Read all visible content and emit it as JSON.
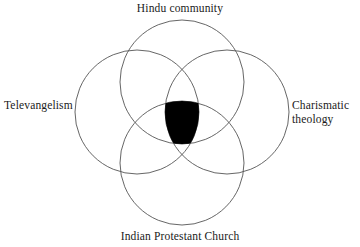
{
  "figure": {
    "type": "venn-diagram-4-circle",
    "background_color": "#ffffff",
    "stroke_color": "#555555",
    "fill_color": "#ffffff",
    "intersection_fill_color": "#000000",
    "text_color": "#1a1a1a"
  },
  "labels": {
    "top": "Hindu community",
    "left": "Televangelism",
    "right": "Charismatic\ntheology",
    "bottom": "Indian Protestant Church"
  },
  "chart_data": {
    "type": "venn",
    "title": "",
    "sets": [
      {
        "id": "hindu-community",
        "label": "Hindu community",
        "position": "top",
        "cx": 182,
        "cy": 82,
        "r": 62
      },
      {
        "id": "televangelism",
        "label": "Televangelism",
        "position": "left",
        "cx": 137,
        "cy": 112,
        "r": 62
      },
      {
        "id": "charismatic-theology",
        "label": "Charismatic theology",
        "position": "right",
        "cx": 227,
        "cy": 112,
        "r": 62
      },
      {
        "id": "indian-protestant-church",
        "label": "Indian Protestant Church",
        "position": "bottom",
        "cx": 182,
        "cy": 163,
        "r": 62
      }
    ],
    "highlighted_region": {
      "members": [
        "hindu-community",
        "televangelism",
        "charismatic-theology",
        "indian-protestant-church"
      ],
      "shape": "vesica",
      "fill": "#000000",
      "cx": 182,
      "cy": 113,
      "top_y": 79,
      "bottom_y": 147,
      "left_x": 166,
      "right_x": 198
    },
    "legend_position": "outside-labels",
    "grid": false
  }
}
